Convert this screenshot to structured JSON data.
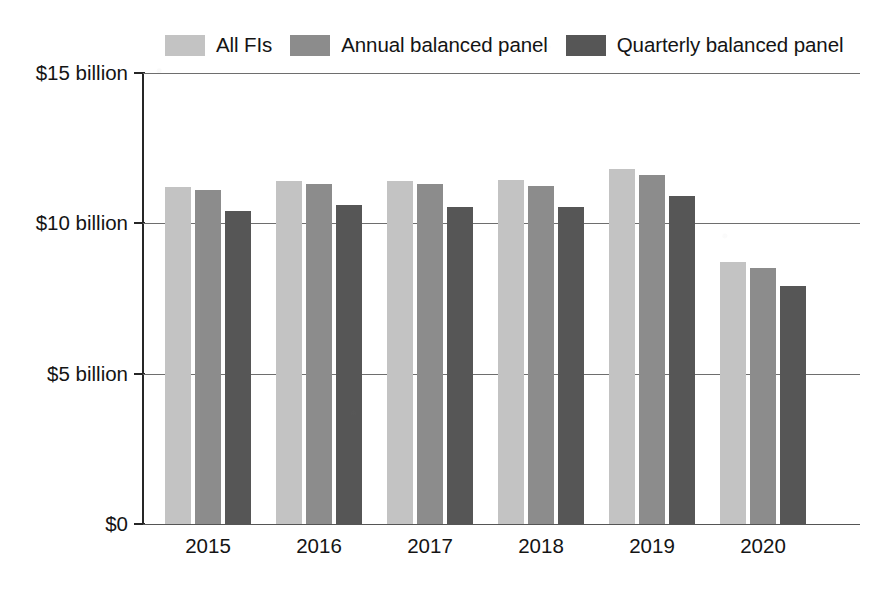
{
  "chart_data": {
    "type": "bar",
    "title": "",
    "subtitle": "",
    "xlabel": "",
    "ylabel": "",
    "categories": [
      "2015",
      "2016",
      "2017",
      "2018",
      "2019",
      "2020"
    ],
    "series": [
      {
        "name": "All FIs",
        "color": "#c3c3c3",
        "values": [
          11.2,
          11.4,
          11.4,
          11.45,
          11.8,
          8.7
        ]
      },
      {
        "name": "Annual balanced panel",
        "color": "#8c8c8c",
        "values": [
          11.1,
          11.3,
          11.3,
          11.25,
          11.6,
          8.5
        ]
      },
      {
        "name": "Quarterly balanced panel",
        "color": "#565656",
        "values": [
          10.4,
          10.6,
          10.55,
          10.55,
          10.9,
          7.9
        ]
      }
    ],
    "ylim": [
      0,
      15
    ],
    "yticks": [
      0,
      5,
      10,
      15
    ],
    "ytick_labels": [
      "$0",
      "$5 billion",
      "$10 billion",
      "$15 billion"
    ],
    "grid": true,
    "legend_position": "top",
    "units": "billions of dollars"
  },
  "legend": {
    "items": [
      {
        "label": "All FIs",
        "color": "#c3c3c3"
      },
      {
        "label": "Annual balanced panel",
        "color": "#8c8c8c"
      },
      {
        "label": "Quarterly balanced panel",
        "color": "#565656"
      }
    ]
  },
  "axes": {
    "y_labels": [
      "$15 billion",
      "$10 billion",
      "$5 billion",
      "$0"
    ],
    "x_labels": [
      "2015",
      "2016",
      "2017",
      "2018",
      "2019",
      "2020"
    ]
  }
}
